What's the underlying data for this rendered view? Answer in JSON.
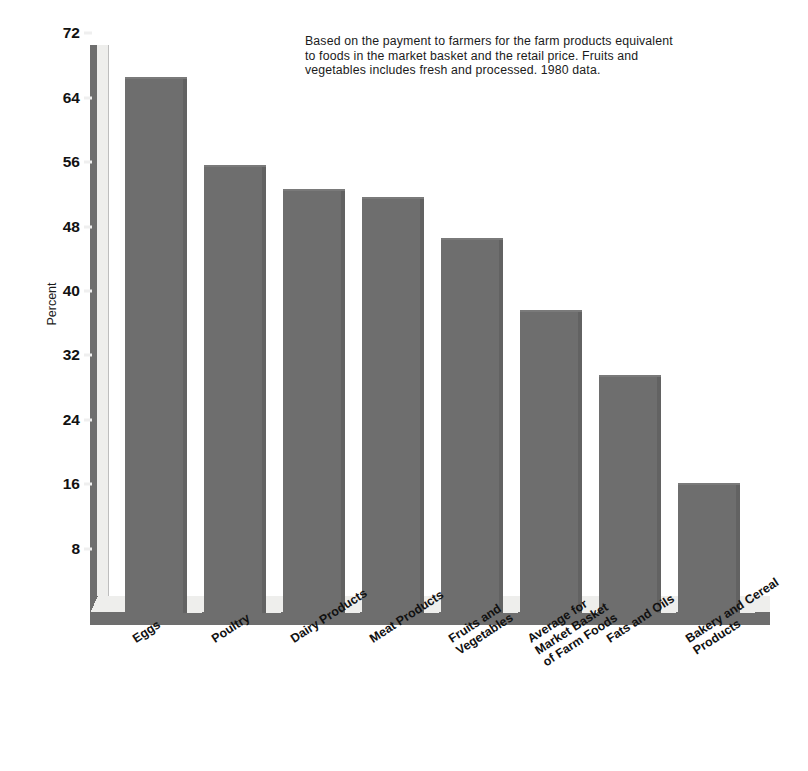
{
  "chart_data": {
    "type": "bar",
    "title": "",
    "subtitle": "",
    "note": "Based on the payment to farmers for the farm products equivalent\nto foods in the market basket and the retail price.  Fruits and\nvegetables includes fresh and processed.  1980 data.",
    "xlabel": "",
    "ylabel": "Percent",
    "ylim": [
      0,
      72
    ],
    "yticks": [
      8,
      16,
      24,
      32,
      40,
      48,
      56,
      64,
      72
    ],
    "ytick_labels": [
      "8",
      "16",
      "24",
      "32",
      "40",
      "48",
      "56",
      "64",
      "72"
    ],
    "grid": false,
    "legend": null,
    "categories": [
      "Eggs",
      "Poultry",
      "Dairy Products",
      "Meat Products",
      "Fruits and\nVegetables",
      "Average for\nMarket Basket\nof Farm Foods",
      "Fats and Oils",
      "Bakery and Cereal\nProducts"
    ],
    "values": [
      66.5,
      55.5,
      52.5,
      51.5,
      46.5,
      37.5,
      29.5,
      16.0
    ],
    "bar_color": "#6e6e6e",
    "axis_color": "#6e6e6e",
    "floor_color": "#eeeeec",
    "text_color": "#111111",
    "background": "#ffffff"
  }
}
